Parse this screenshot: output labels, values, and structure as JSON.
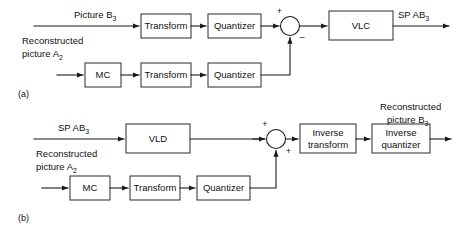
{
  "figure": {
    "background_color": "#ffffff",
    "line_color": "#1a1a1a",
    "box_stroke_color": "#2b2b2b",
    "box_fill_color": "#ffffff",
    "text_color": "#111111"
  },
  "panel_a": {
    "caption": "(a)",
    "inputs": {
      "top_label_main": "Picture B",
      "top_label_sub": "3",
      "bottom_label_line1": "Reconstructed",
      "bottom_label_line2_main": "picture A",
      "bottom_label_line2_sub": "2"
    },
    "blocks": [
      {
        "id": "a-transform-top",
        "label": "Transform"
      },
      {
        "id": "a-quantizer-top",
        "label": "Quantizer"
      },
      {
        "id": "a-vlc",
        "label": "VLC"
      },
      {
        "id": "a-mc",
        "label": "MC"
      },
      {
        "id": "a-transform-bottom",
        "label": "Transform"
      },
      {
        "id": "a-quantizer-bottom",
        "label": "Quantizer"
      }
    ],
    "summing_junction": {
      "sign_top": "+",
      "sign_bottom": "–"
    },
    "output": {
      "label_main": "SP AB",
      "label_sub": "3"
    }
  },
  "panel_b": {
    "caption": "(b)",
    "inputs": {
      "top_label_main": "SP AB",
      "top_label_sub": "3",
      "bottom_label_line1": "Reconstructed",
      "bottom_label_line2_main": "picture A",
      "bottom_label_line2_sub": "2"
    },
    "blocks": [
      {
        "id": "b-vld",
        "label": "VLD"
      },
      {
        "id": "b-inverse-transform",
        "label_line1": "Inverse",
        "label_line2": "transform"
      },
      {
        "id": "b-inverse-quantizer",
        "label_line1": "Inverse",
        "label_line2": "quantizer"
      },
      {
        "id": "b-mc",
        "label": "MC"
      },
      {
        "id": "b-transform",
        "label": "Transform"
      },
      {
        "id": "b-quantizer",
        "label": "Quantizer"
      }
    ],
    "summing_junction": {
      "sign_top": "+",
      "sign_bottom": "+"
    },
    "output": {
      "label_line1": "Reconstructed",
      "label_line2_main": "picture B",
      "label_line2_sub": "3"
    }
  }
}
